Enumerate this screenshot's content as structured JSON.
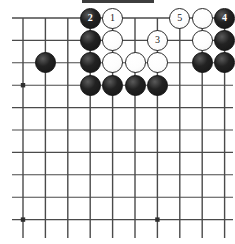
{
  "diagram": {
    "kind": "go-board-problem",
    "title_mark": "",
    "caption": "",
    "board": {
      "cols": 10,
      "rows": 10,
      "origin_x": 23,
      "origin_y": 18,
      "spacing": 22.4,
      "line_color": "#4a4a4a",
      "background": "#ffffff",
      "star_points": [
        {
          "col": 1,
          "row": 4
        },
        {
          "col": 1,
          "row": 10
        },
        {
          "col": 7,
          "row": 10
        }
      ],
      "edges": {
        "top": true,
        "left": false,
        "right": false,
        "bottom": false
      }
    },
    "colors": {
      "black_stone": "#1a1a1a",
      "white_stone": "#ffffff",
      "white_outline": "#2b2b2b",
      "black_label": "#ffffff",
      "white_label": "#1a1a1a"
    },
    "stones": [
      {
        "col": 4,
        "row": 1,
        "color": "black",
        "label": "2"
      },
      {
        "col": 5,
        "row": 1,
        "color": "white",
        "label": "1"
      },
      {
        "col": 8,
        "row": 1,
        "color": "white",
        "label": "5"
      },
      {
        "col": 9,
        "row": 1,
        "color": "white",
        "label": ""
      },
      {
        "col": 10,
        "row": 1,
        "color": "black",
        "label": "4"
      },
      {
        "col": 4,
        "row": 2,
        "color": "black",
        "label": ""
      },
      {
        "col": 5,
        "row": 2,
        "color": "white",
        "label": ""
      },
      {
        "col": 7,
        "row": 2,
        "color": "white",
        "label": "3"
      },
      {
        "col": 9,
        "row": 2,
        "color": "white",
        "label": ""
      },
      {
        "col": 10,
        "row": 2,
        "color": "black",
        "label": ""
      },
      {
        "col": 2,
        "row": 3,
        "color": "black",
        "label": ""
      },
      {
        "col": 4,
        "row": 3,
        "color": "black",
        "label": ""
      },
      {
        "col": 5,
        "row": 3,
        "color": "white",
        "label": ""
      },
      {
        "col": 6,
        "row": 3,
        "color": "white",
        "label": ""
      },
      {
        "col": 7,
        "row": 3,
        "color": "white",
        "label": ""
      },
      {
        "col": 9,
        "row": 3,
        "color": "black",
        "label": ""
      },
      {
        "col": 10,
        "row": 3,
        "color": "black",
        "label": ""
      },
      {
        "col": 4,
        "row": 4,
        "color": "black",
        "label": ""
      },
      {
        "col": 5,
        "row": 4,
        "color": "black",
        "label": ""
      },
      {
        "col": 6,
        "row": 4,
        "color": "black",
        "label": ""
      },
      {
        "col": 7,
        "row": 4,
        "color": "black",
        "label": ""
      }
    ],
    "move_order": [
      "1",
      "2",
      "3",
      "4",
      "5"
    ]
  }
}
